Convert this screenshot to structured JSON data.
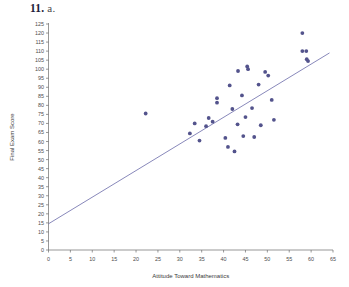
{
  "header": {
    "number": "11.",
    "part": "a."
  },
  "chart_data": {
    "type": "scatter",
    "title": "",
    "xlabel": "Attitude Toward Mathematics",
    "ylabel": "Final Exam Score",
    "xlim": [
      0,
      65
    ],
    "ylim": [
      0,
      125
    ],
    "xticks": [
      0,
      5,
      10,
      15,
      20,
      25,
      30,
      35,
      40,
      45,
      50,
      55,
      60,
      65
    ],
    "yticks": [
      0,
      5,
      10,
      15,
      20,
      25,
      30,
      35,
      40,
      45,
      50,
      55,
      60,
      65,
      70,
      75,
      80,
      85,
      90,
      95,
      100,
      105,
      110,
      115,
      120,
      125
    ],
    "grid": false,
    "legend": null,
    "point_color": "#53538c",
    "line_color": "#6a6aa8",
    "points": [
      {
        "x": 22.2,
        "y": 75.5
      },
      {
        "x": 32.3,
        "y": 64.5
      },
      {
        "x": 33.4,
        "y": 70.0
      },
      {
        "x": 34.5,
        "y": 60.5
      },
      {
        "x": 36.0,
        "y": 68.5
      },
      {
        "x": 36.6,
        "y": 73.0
      },
      {
        "x": 37.5,
        "y": 71.0
      },
      {
        "x": 38.5,
        "y": 84.0
      },
      {
        "x": 38.5,
        "y": 81.5
      },
      {
        "x": 40.4,
        "y": 62.0
      },
      {
        "x": 41.0,
        "y": 57.0
      },
      {
        "x": 41.4,
        "y": 91.0
      },
      {
        "x": 42.0,
        "y": 78.0
      },
      {
        "x": 42.5,
        "y": 54.5
      },
      {
        "x": 43.2,
        "y": 69.5
      },
      {
        "x": 43.3,
        "y": 99.0
      },
      {
        "x": 44.2,
        "y": 85.5
      },
      {
        "x": 44.5,
        "y": 63.0
      },
      {
        "x": 45.0,
        "y": 73.5
      },
      {
        "x": 45.4,
        "y": 101.5
      },
      {
        "x": 45.6,
        "y": 100.0
      },
      {
        "x": 46.5,
        "y": 78.5
      },
      {
        "x": 47.0,
        "y": 62.5
      },
      {
        "x": 48.0,
        "y": 91.5
      },
      {
        "x": 48.5,
        "y": 69.0
      },
      {
        "x": 49.5,
        "y": 98.5
      },
      {
        "x": 50.2,
        "y": 96.5
      },
      {
        "x": 51.0,
        "y": 83.0
      },
      {
        "x": 51.5,
        "y": 72.0
      },
      {
        "x": 58.0,
        "y": 120.0
      },
      {
        "x": 58.0,
        "y": 110.0
      },
      {
        "x": 58.9,
        "y": 110.0
      },
      {
        "x": 59.0,
        "y": 105.5
      },
      {
        "x": 59.3,
        "y": 104.5
      }
    ],
    "trend_line": {
      "x1": 0,
      "y1": 14.5,
      "x2": 64.2,
      "y2": 109.0
    }
  }
}
